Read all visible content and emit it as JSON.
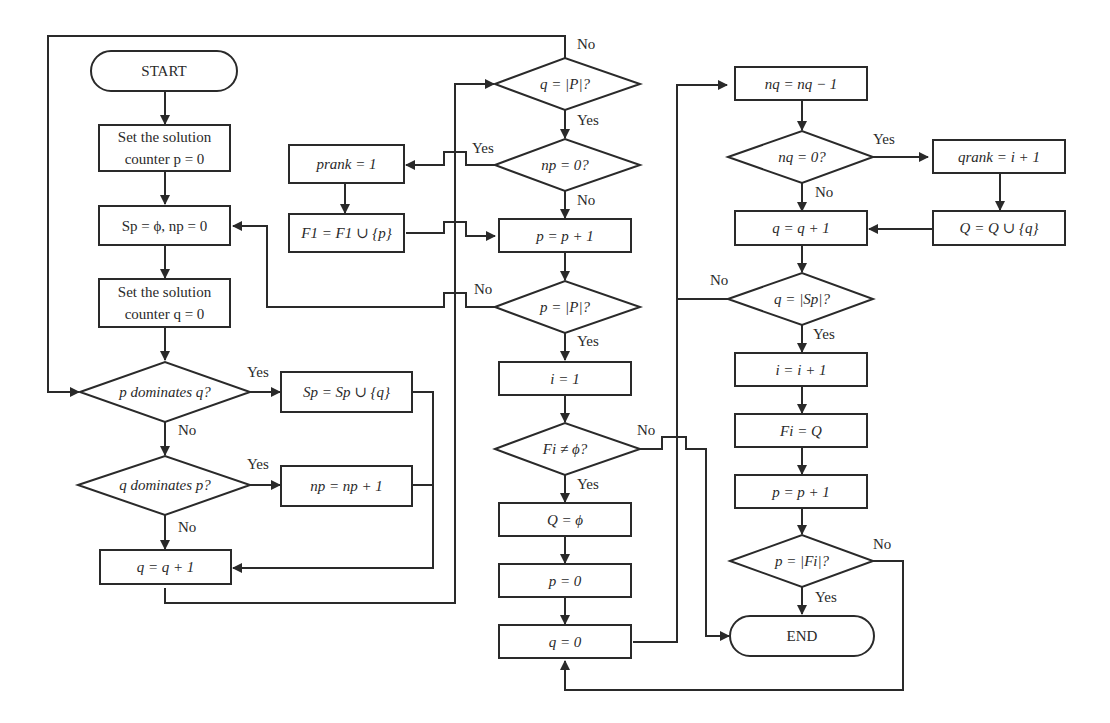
{
  "diagram": {
    "type": "flowchart",
    "title": "",
    "nodes": {
      "start": "START",
      "set_p": "Set the solution counter p = 0",
      "init_sp": "Sp = ϕ, np = 0",
      "set_q": "Set the solution counter q = 0",
      "p_dom_q": "p dominates q?",
      "sp_union": "Sp = Sp ∪ {q}",
      "q_dom_p": "q dominates p?",
      "np_inc": "np = np + 1",
      "q_inc_left": "q = q + 1",
      "q_eq_P": "q = |P|?",
      "np_zero": "np = 0?",
      "prank": "prank = 1",
      "f1_union": "F1 = F1 ∪ {p}",
      "p_inc_mid": "p = p + 1",
      "p_eq_P": "p = |P|?",
      "i_one": "i = 1",
      "fi_nonempty": "Fi ≠ ϕ?",
      "q_empty": "Q = ϕ",
      "p_zero": "p = 0",
      "q_zero": "q = 0",
      "nq_dec": "nq = nq − 1",
      "nq_zero": "nq = 0?",
      "qrank": "qrank = i + 1",
      "q_union": "Q = Q ∪ {q}",
      "q_inc_right": "q = q + 1",
      "q_eq_Sp": "q = |Sp|?",
      "i_inc": "i = i + 1",
      "fi_eq_q": "Fi = Q",
      "p_inc_right": "p = p + 1",
      "p_eq_Fi": "p = |Fi|?",
      "end": "END"
    },
    "edge_labels": {
      "yes": "Yes",
      "no": "No"
    }
  }
}
